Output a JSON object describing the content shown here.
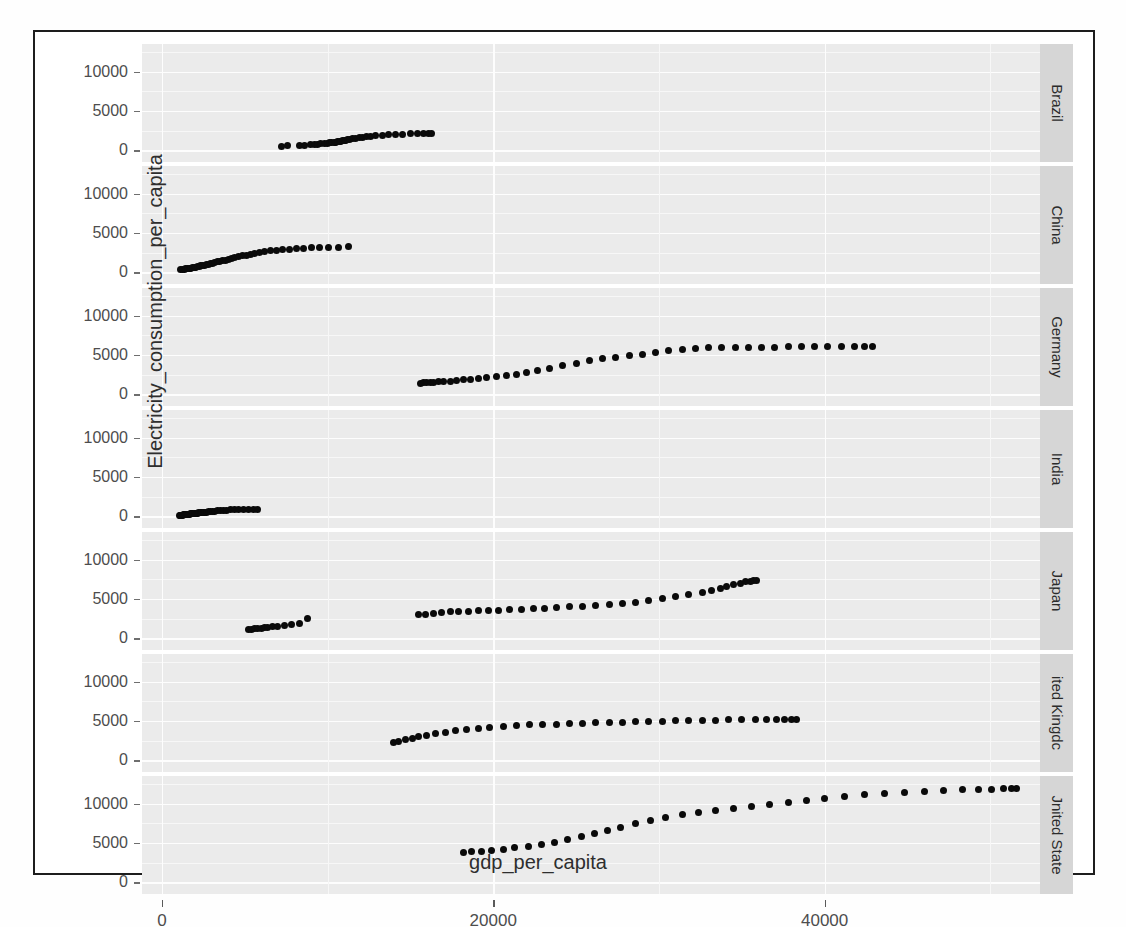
{
  "title_remnant": "",
  "axes": {
    "xlabel": "gdp_per_capita",
    "ylabel": "Electricity_consumption_per_capita",
    "xticks": [
      "0",
      "20000",
      "40000"
    ],
    "yticks": [
      "0",
      "5000",
      "10000"
    ]
  },
  "facets": [
    {
      "label": "Brazil"
    },
    {
      "label": "China"
    },
    {
      "label": "Germany"
    },
    {
      "label": "India"
    },
    {
      "label": "Japan"
    },
    {
      "label": "ited Kingdc"
    },
    {
      "label": "Jnited State"
    }
  ],
  "chart_data": {
    "type": "scatter",
    "title": "",
    "xlabel": "gdp_per_capita",
    "ylabel": "Electricity_consumption_per_capita",
    "xlim": [
      -1200,
      53000
    ],
    "ylim": [
      -1500,
      13500
    ],
    "xticks": [
      0,
      20000,
      40000
    ],
    "yticks": [
      0,
      5000,
      10000
    ],
    "grid": true,
    "legend": "none",
    "facet_by": "country",
    "facet_position": "right",
    "point_color": "#0a0a0a",
    "panel_background": "#ebebeb",
    "series": [
      {
        "name": "Brazil",
        "x": [
          7200,
          7600,
          8300,
          8600,
          9000,
          9200,
          9400,
          9600,
          9800,
          10000,
          10100,
          10250,
          10400,
          10500,
          10600,
          10700,
          10800,
          10900,
          11000,
          11100,
          11200,
          11350,
          11500,
          11700,
          11900,
          12100,
          12350,
          12600,
          12900,
          13300,
          13700,
          14100,
          14500,
          15000,
          15400,
          15800,
          16100,
          16300
        ],
        "y": [
          520,
          560,
          600,
          640,
          700,
          740,
          770,
          800,
          840,
          880,
          920,
          960,
          1000,
          1040,
          1080,
          1120,
          1160,
          1200,
          1240,
          1290,
          1340,
          1400,
          1460,
          1520,
          1580,
          1640,
          1700,
          1760,
          1820,
          1880,
          1940,
          1990,
          2030,
          2060,
          2090,
          2110,
          2130,
          2150
        ]
      },
      {
        "name": "China",
        "x": [
          1150,
          1250,
          1350,
          1450,
          1550,
          1650,
          1750,
          1850,
          1950,
          2050,
          2150,
          2250,
          2350,
          2450,
          2560,
          2680,
          2800,
          2930,
          3060,
          3200,
          3350,
          3500,
          3660,
          3830,
          4010,
          4200,
          4400,
          4620,
          4850,
          5090,
          5350,
          5620,
          5910,
          6220,
          6550,
          6900,
          7280,
          7680,
          8100,
          8550,
          9030,
          9540,
          10080,
          10650,
          11250
        ],
        "y": [
          330,
          360,
          390,
          420,
          450,
          480,
          520,
          560,
          600,
          640,
          690,
          740,
          790,
          840,
          900,
          960,
          1020,
          1080,
          1150,
          1220,
          1300,
          1380,
          1460,
          1550,
          1640,
          1740,
          1840,
          1950,
          2060,
          2180,
          2300,
          2420,
          2530,
          2630,
          2720,
          2800,
          2870,
          2930,
          2990,
          3040,
          3090,
          3130,
          3160,
          3190,
          3210
        ]
      },
      {
        "name": "Germany",
        "x": [
          15600,
          15800,
          16000,
          16200,
          16400,
          16700,
          17000,
          17400,
          17800,
          18200,
          18600,
          19100,
          19600,
          20200,
          20800,
          21400,
          22000,
          22700,
          23400,
          24200,
          25000,
          25800,
          26600,
          27400,
          28200,
          29000,
          29800,
          30600,
          31400,
          32200,
          33000,
          33800,
          34600,
          35400,
          36200,
          37000,
          37800,
          38600,
          39400,
          40200,
          41000,
          41800,
          42400,
          42900
        ],
        "y": [
          1420,
          1440,
          1460,
          1490,
          1520,
          1560,
          1610,
          1670,
          1740,
          1820,
          1900,
          2000,
          2100,
          2220,
          2350,
          2500,
          2700,
          2950,
          3250,
          3600,
          3950,
          4250,
          4500,
          4700,
          4900,
          5100,
          5300,
          5500,
          5650,
          5780,
          5880,
          5930,
          5960,
          5980,
          5990,
          6000,
          6010,
          6020,
          6030,
          6050,
          6080,
          6100,
          6090,
          6070
        ]
      },
      {
        "name": "India",
        "x": [
          1050,
          1100,
          1150,
          1200,
          1250,
          1300,
          1350,
          1400,
          1450,
          1500,
          1560,
          1620,
          1680,
          1740,
          1800,
          1870,
          1940,
          2010,
          2080,
          2160,
          2240,
          2320,
          2400,
          2500,
          2600,
          2700,
          2810,
          2930,
          3060,
          3200,
          3350,
          3520,
          3700,
          3900,
          4120,
          4360,
          4620,
          4900,
          5200,
          5500,
          5800
        ],
        "y": [
          110,
          120,
          130,
          140,
          150,
          160,
          175,
          190,
          205,
          220,
          235,
          250,
          265,
          280,
          295,
          315,
          335,
          355,
          375,
          395,
          415,
          435,
          455,
          480,
          505,
          530,
          555,
          580,
          610,
          640,
          670,
          700,
          730,
          760,
          790,
          820,
          845,
          865,
          880,
          895,
          905
        ]
      },
      {
        "name": "Japan",
        "x": [
          5200,
          5400,
          5600,
          5800,
          6000,
          6200,
          6400,
          6700,
          7000,
          7400,
          7800,
          8300,
          8800,
          15500,
          15900,
          16400,
          16900,
          17400,
          17900,
          18500,
          19100,
          19700,
          20300,
          21000,
          21700,
          22400,
          23100,
          23800,
          24600,
          25400,
          26200,
          27000,
          27800,
          28600,
          29400,
          30200,
          31000,
          31800,
          32600,
          33200,
          33700,
          34100,
          34500,
          34900,
          35200,
          35500,
          35700,
          35900
        ],
        "y": [
          1120,
          1160,
          1200,
          1240,
          1290,
          1340,
          1400,
          1470,
          1550,
          1650,
          1760,
          1900,
          2500,
          2950,
          3050,
          3150,
          3250,
          3340,
          3400,
          3440,
          3490,
          3530,
          3580,
          3640,
          3700,
          3760,
          3830,
          3900,
          3980,
          4060,
          4150,
          4250,
          4400,
          4600,
          4820,
          5050,
          5300,
          5550,
          5800,
          6050,
          6300,
          6550,
          6800,
          7000,
          7150,
          7250,
          7330,
          7380
        ]
      },
      {
        "name": "ited Kingdc",
        "x": [
          14000,
          14300,
          14700,
          15100,
          15500,
          16000,
          16500,
          17100,
          17700,
          18400,
          19100,
          19800,
          20600,
          21400,
          22200,
          23000,
          23800,
          24600,
          25400,
          26200,
          27000,
          27800,
          28600,
          29400,
          30200,
          31000,
          31800,
          32600,
          33400,
          34200,
          35000,
          35800,
          36500,
          37100,
          37600,
          38000,
          38300
        ],
        "y": [
          2230,
          2400,
          2600,
          2800,
          3000,
          3200,
          3400,
          3580,
          3750,
          3900,
          4050,
          4180,
          4300,
          4400,
          4480,
          4550,
          4600,
          4650,
          4700,
          4750,
          4800,
          4850,
          4890,
          4930,
          4960,
          4990,
          5020,
          5060,
          5100,
          5140,
          5160,
          5180,
          5190,
          5180,
          5160,
          5140,
          5120
        ]
      },
      {
        "name": "Jnited State",
        "x": [
          18200,
          18700,
          19300,
          19900,
          20600,
          21300,
          22100,
          22900,
          23700,
          24500,
          25300,
          26100,
          26900,
          27700,
          28600,
          29500,
          30400,
          31400,
          32400,
          33400,
          34500,
          35600,
          36700,
          37800,
          38900,
          40000,
          41200,
          42400,
          43600,
          44800,
          46000,
          47200,
          48300,
          49300,
          50100,
          50800,
          51300,
          51600
        ],
        "y": [
          3750,
          3850,
          3960,
          4080,
          4220,
          4380,
          4560,
          4780,
          5050,
          5400,
          5800,
          6200,
          6600,
          7000,
          7400,
          7800,
          8200,
          8550,
          8850,
          9100,
          9350,
          9600,
          9850,
          10100,
          10350,
          10600,
          10850,
          11100,
          11300,
          11450,
          11580,
          11680,
          11750,
          11800,
          11830,
          11850,
          11870,
          11880
        ]
      }
    ]
  }
}
